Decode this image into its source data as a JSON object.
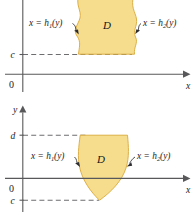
{
  "figure": {
    "name": "type-II-region-diagrams",
    "colors": {
      "region_fill": "#f6dc8d",
      "region_stroke": "#d9a93a",
      "axis": "#58585a",
      "dash": "#6d6d70",
      "text": "#1b1b1d"
    },
    "panels": [
      {
        "id": "top-panel",
        "axis_x_label": "x",
        "axis_y_label": "",
        "tick_labels": [
          "c"
        ],
        "origin_label": "0",
        "region_label": "D",
        "left_curve_label": "x = h",
        "left_curve_sub": "1",
        "left_curve_tail": "(y)",
        "right_curve_label": "x = h",
        "right_curve_sub": "2",
        "right_curve_tail": "(y)"
      },
      {
        "id": "bottom-panel",
        "axis_x_label": "x",
        "axis_y_label": "y",
        "tick_labels": [
          "d",
          "c"
        ],
        "origin_label": "0",
        "region_label": "D",
        "left_curve_label": "x = h",
        "left_curve_sub": "1",
        "left_curve_tail": "(y)",
        "right_curve_label": "x = h",
        "right_curve_sub": "2",
        "right_curve_tail": "(y)"
      }
    ]
  }
}
